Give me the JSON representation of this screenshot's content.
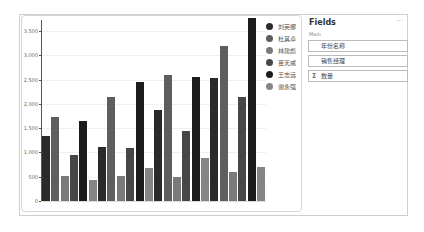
{
  "chart_data": {
    "type": "bar",
    "title": "",
    "xlabel": "",
    "ylabel": "",
    "ylim": [
      0,
      3800
    ],
    "yticks": [
      0,
      500,
      1000,
      1500,
      2000,
      2500,
      3000,
      3500
    ],
    "ytick_labels": [
      "0",
      "500",
      "1,000",
      "1,500",
      "2,000",
      "2,500",
      "3,000",
      "3,500"
    ],
    "grid": true,
    "legend_position": "right",
    "categories": [
      "Group 1",
      "Group 2",
      "Group 3",
      "Group 4"
    ],
    "series": [
      {
        "name": "刘英娜",
        "color": "#2a2a2a",
        "values": [
          1340,
          1110,
          1880,
          2540
        ]
      },
      {
        "name": "杜其卓",
        "color": "#5e5e5e",
        "values": [
          1730,
          2140,
          2600,
          3200
        ]
      },
      {
        "name": "林建彪",
        "color": "#7a7a7a",
        "values": [
          510,
          510,
          490,
          600
        ]
      },
      {
        "name": "苗天戚",
        "color": "#474747",
        "values": [
          950,
          1090,
          1440,
          2150
        ]
      },
      {
        "name": "王志远",
        "color": "#1c1c1c",
        "values": [
          1650,
          2450,
          2560,
          3760
        ]
      },
      {
        "name": "谢永强",
        "color": "#858585",
        "values": [
          430,
          680,
          880,
          700
        ]
      }
    ]
  },
  "fields_panel": {
    "title": "Fields",
    "more": "···",
    "section": "Main",
    "wells": [
      {
        "label": "年份名称",
        "sigma": ""
      },
      {
        "label": "销售经理",
        "sigma": ""
      },
      {
        "label": "数量",
        "sigma": "Σ"
      }
    ]
  }
}
